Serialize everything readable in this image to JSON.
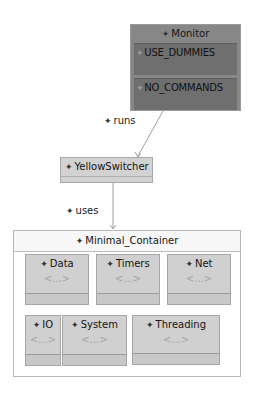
{
  "nodes": {
    "monitor": {
      "title": "Monitor",
      "fields": [
        {
          "label": "USE_DUMMIES"
        },
        {
          "label": "NO_COMMANDS"
        }
      ]
    },
    "yellow_switcher": {
      "title": "YellowSwitcher"
    },
    "container": {
      "title": "Minimal_Container",
      "packages": [
        {
          "title": "Data",
          "body": "<...>"
        },
        {
          "title": "Timers",
          "body": "<...>"
        },
        {
          "title": "Net",
          "body": "<...>"
        },
        {
          "title": "IO",
          "body": "<...>"
        },
        {
          "title": "System",
          "body": "<...>"
        },
        {
          "title": "Threading",
          "body": "<...>"
        }
      ]
    }
  },
  "edges": [
    {
      "label": "runs",
      "from": "Monitor",
      "to": "YellowSwitcher"
    },
    {
      "label": "uses",
      "from": "YellowSwitcher",
      "to": "Minimal_Container"
    }
  ],
  "icons": {
    "element_marker": "✦"
  },
  "colors": {
    "monitor_fill": "#878787",
    "field_fill": "#6f6f6f",
    "node_fill": "#d0d0d0",
    "edge_color": "#9a9a9a"
  }
}
